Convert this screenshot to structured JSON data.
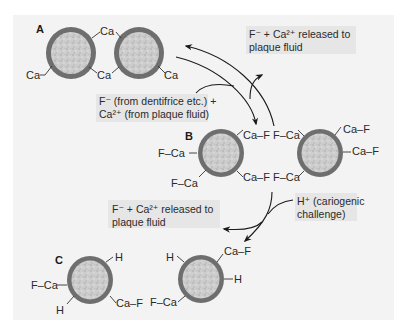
{
  "figure": {
    "background": "#f3f3f3",
    "crystal": {
      "ring_color": "#6e6e6e",
      "core_color": "#c9c9c9"
    },
    "note_box_color": "#e6e6e6"
  },
  "panels": {
    "A": {
      "letter": "A",
      "labels": [
        "Ca",
        "Ca",
        "Ca",
        "Ca"
      ]
    },
    "B": {
      "letter": "B",
      "left_crystal_labels": [
        "Ca–F",
        "F–Ca",
        "F–Ca",
        "Ca–F"
      ],
      "right_crystal_labels": [
        "F–Ca",
        "Ca–F",
        "Ca–F",
        "F–Ca"
      ]
    },
    "C": {
      "letter": "C",
      "left_crystal_labels": [
        "H",
        "F–Ca",
        "H",
        "Ca–F"
      ],
      "right_crystal_labels": [
        "H",
        "Ca–F",
        "H",
        "F–Ca"
      ]
    }
  },
  "notes": {
    "released_top": {
      "line1": "F⁻ + Ca²⁺  released to",
      "line2": "plaque fluid"
    },
    "fluoride_source": {
      "line1": "F⁻ (from dentifrice etc.) +",
      "line2": "Ca²⁺ (from plaque fluid)"
    },
    "released_bottom": {
      "line1": "F⁻ + Ca²⁺ released to",
      "line2": "plaque fluid"
    },
    "cariogenic": {
      "line1": "H⁺ (cariogenic",
      "line2": "challenge)"
    }
  }
}
